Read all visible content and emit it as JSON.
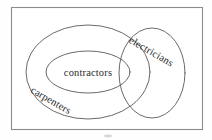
{
  "diagram": {
    "kind": "euler-venn-diagram",
    "frame": {
      "stroke_color": "#8c8c8c",
      "fill_color": "#ffffff"
    },
    "curve_color": "#595959",
    "text_color": "#2b2b2b",
    "sets": [
      {
        "id": "carpenters",
        "label": "carpenters",
        "shape": "ellipse",
        "cx": 88,
        "cy": 72,
        "rx": 62,
        "ry": 47,
        "label_x": 30,
        "label_y": 92,
        "label_rotation": 30
      },
      {
        "id": "contractors",
        "label": "contractors",
        "shape": "ellipse",
        "cx": 88,
        "cy": 72,
        "rx": 42,
        "ry": 21,
        "label_x": 88,
        "label_y": 76,
        "label_rotation": 0
      },
      {
        "id": "electricians",
        "label": "electricians",
        "shape": "circle",
        "cx": 152,
        "cy": 73,
        "rx": 33,
        "ry": 45,
        "label_x": 128,
        "label_y": 42,
        "label_rotation": 30
      }
    ]
  }
}
